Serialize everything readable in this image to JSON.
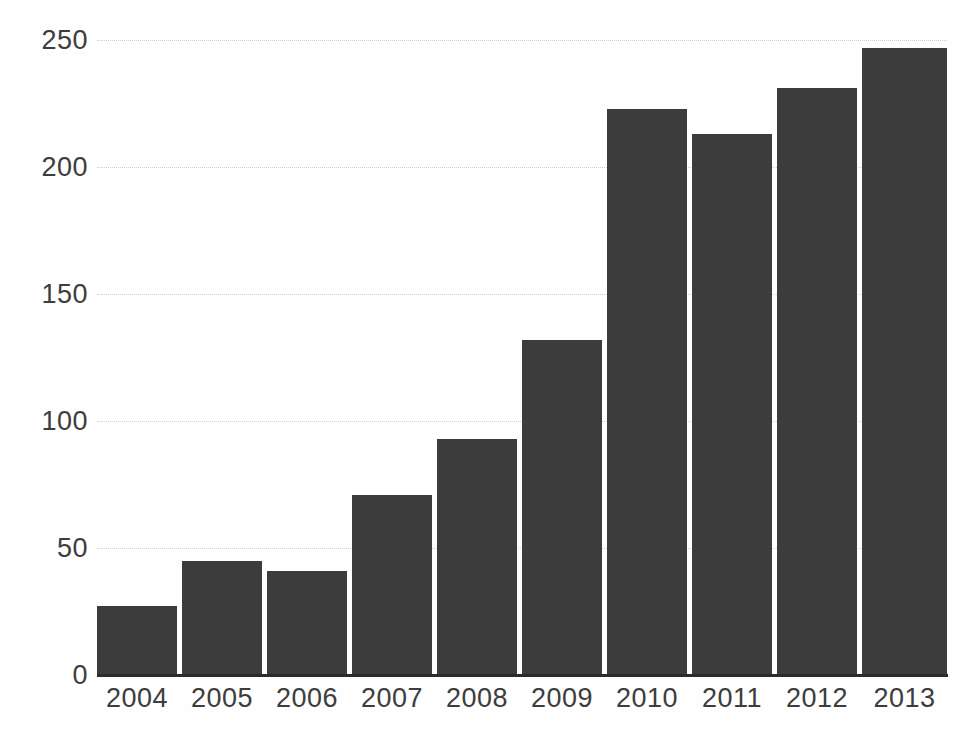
{
  "chart_data": {
    "type": "bar",
    "title": "",
    "subtitle": "",
    "xlabel": "",
    "ylabel": "",
    "categories": [
      "2004",
      "2005",
      "2006",
      "2007",
      "2008",
      "2009",
      "2010",
      "2011",
      "2012",
      "2013"
    ],
    "values": [
      27,
      45,
      41,
      71,
      93,
      132,
      223,
      213,
      231,
      247
    ],
    "series": [
      {
        "name": "",
        "values": [
          27,
          45,
          41,
          71,
          93,
          132,
          223,
          213,
          231,
          247
        ]
      }
    ],
    "ylim": [
      0,
      250
    ],
    "xlim": [
      0,
      10
    ],
    "y_ticks": [
      0,
      50,
      100,
      150,
      200,
      250
    ],
    "y_tick_labels": [
      "0",
      "50",
      "100",
      "150",
      "200",
      "250"
    ],
    "x_tick_labels": [
      "2004",
      "2005",
      "2006",
      "2007",
      "2008",
      "2009",
      "2010",
      "2011",
      "2012",
      "2013"
    ],
    "grid": true,
    "grid_axis": "y",
    "grid_style": "dotted",
    "legend": false,
    "legend_position": "none",
    "annotations": [],
    "colors": {
      "bar": "#3c3c3c",
      "gridline": "#cfcfcf",
      "axis": "#2b2b2b",
      "tick_label": "#3d3d3d",
      "background": "#fefefe"
    }
  }
}
